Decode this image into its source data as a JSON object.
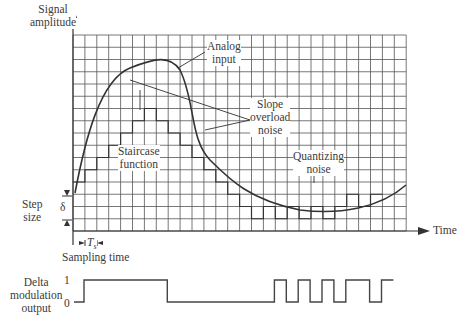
{
  "labels": {
    "y_axis": [
      "Signal",
      "amplitude"
    ],
    "x_axis": "Time",
    "analog_input": [
      "Analog",
      "input"
    ],
    "slope_overload": [
      "Slope",
      "overload",
      "noise"
    ],
    "quantizing": [
      "Quantizing",
      "noise"
    ],
    "staircase": [
      "Staircase",
      "function"
    ],
    "step_size": [
      "Step",
      "size"
    ],
    "delta": "δ",
    "ts": "T",
    "ts_sub": "s",
    "sampling_time": "Sampling time",
    "dm_output": [
      "Delta",
      "modulation",
      "output"
    ],
    "level_1": "1",
    "level_0": "0"
  },
  "colors": {
    "grid": "#444444",
    "fill": "#d6d6d6",
    "curve": "#333333"
  },
  "grid": {
    "x0": 73,
    "y0": 35,
    "cols": 28,
    "rows": 16,
    "cell_w": 11.9,
    "cell_h": 12.25
  },
  "dm_bits": [
    1,
    1,
    1,
    1,
    1,
    1,
    1,
    0,
    0,
    0,
    0,
    0,
    0,
    0,
    0,
    0,
    1,
    0,
    1,
    0,
    1,
    0,
    1,
    1,
    0,
    1
  ]
}
